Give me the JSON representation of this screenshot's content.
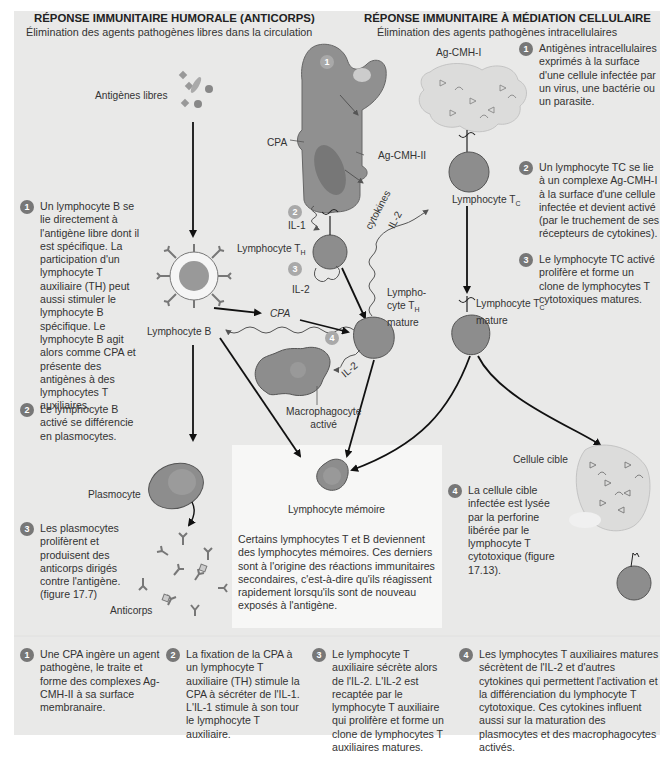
{
  "humoral": {
    "title": "RÉPONSE IMMUNITAIRE HUMORALE (ANTICORPS)",
    "subtitle": "Élimination des agents pathogènes libres dans la circulation",
    "steps": [
      {
        "number": "1",
        "text": "Un lymphocyte B se lie directement à l'antigène libre dont il est spécifique. La participation d'un lymphocyte T auxiliaire (TH) peut aussi stimuler le lymphocyte B spécifique. Le lymphocyte B agit alors comme CPA et présente des antigènes à des lymphocytes T auxiliaires."
      },
      {
        "number": "2",
        "text": "Le lymphocyte B activé se différencie en plasmocytes."
      },
      {
        "number": "3",
        "text": "Les plasmocytes prolifèrent et produisent des anticorps dirigés contre l'antigène. (figure 17.7)"
      }
    ]
  },
  "cellular": {
    "title": "RÉPONSE IMMUNITAIRE À MÉDIATION CELLULAIRE",
    "subtitle": "Élimination des agents pathogènes intracellulaires",
    "steps": [
      {
        "number": "1",
        "text": "Antigènes intracellulaires exprimés à la surface d'une cellule infectée par un virus, une bactérie ou un parasite."
      },
      {
        "number": "2",
        "text": "Un lymphocyte TC se lie à un complexe Ag-CMH-I à la surface d'une cellule infectée et devient activé (par le truchement de ses récepteurs de cytokines)."
      },
      {
        "number": "3",
        "text": "Le lymphocyte TC activé prolifère et forme un clone de lymphocytes T cytotoxiques matures."
      },
      {
        "number": "4",
        "text": "La cellule cible infectée est lysée par la perforine libérée par le lymphocyte T cytotoxique (figure 17.13)."
      }
    ]
  },
  "labels": {
    "free_antigens": "Antigènes libres",
    "cpa": "CPA",
    "ag_cmh_ii": "Ag-CMH-II",
    "ag_cmh_i": "Ag-CMH-I",
    "il1": "IL-1",
    "il2_a": "IL-2",
    "il2_b": "IL-2",
    "il2_c": "IL-2",
    "cytokines": "cytokines",
    "lymphocyte_th": "Lymphocyte T",
    "lymphocyte_th_sub": "H",
    "lymphocyte_th_mature_1": "Lympho-",
    "lymphocyte_th_mature_2": "cyte T",
    "lymphocyte_th_mature_3": "mature",
    "lymphocyte_b": "Lymphocyte B",
    "cpa_arrow": "CPA",
    "macrophage_1": "Macrophagocyte",
    "macrophage_2": "activé",
    "lymphocyte_tc": "Lymphocyte T",
    "lymphocyte_tc_sub": "C",
    "lymphocyte_tc_mature_1": "Lymphocyte T",
    "lymphocyte_tc_mature_2": "mature",
    "plasmocyte": "Plasmocyte",
    "anticorps": "Anticorps",
    "memory": "Lymphocyte mémoire",
    "target_cell": "Cellule cible"
  },
  "diagram_markers": [
    "1",
    "2",
    "3",
    "4"
  ],
  "memory_text": "Certains lymphocytes T et B deviennent des lymphocytes mémoires. Ces derniers sont à l'origine des réactions immunitaires secondaires, c'est-à-dire qu'ils réagissent rapidement lorsqu'ils sont de nouveau exposés à l'antigène.",
  "bottom_steps": [
    {
      "number": "1",
      "text": "Une CPA ingère un agent pathogène, le traite et forme des complexes Ag-CMH-II à sa surface membranaire."
    },
    {
      "number": "2",
      "text": "La fixation de la CPA à un lymphocyte T auxiliaire (TH) stimule la CPA à sécréter de l'IL-1. L'IL-1 stimule à son tour le lymphocyte T auxiliaire."
    },
    {
      "number": "3",
      "text": "Le lymphocyte T auxiliaire sécrète alors de l'IL-2. L'IL-2 est recaptée par le lymphocyte T auxiliaire qui prolifère et forme un clone de lymphocytes T auxiliaires matures."
    },
    {
      "number": "4",
      "text": "Les lymphocytes T auxiliaires matures sécrètent de l'IL-2 et d'autres cytokines qui permettent l'activation et la différenciation du lymphocyte T cytotoxique. Ces cytokines influent aussi sur la maturation des plasmocytes et des macrophagocytes activés."
    }
  ],
  "colors": {
    "panel": "#e9e9e8",
    "cell": "#8f8f8f",
    "nucleus": "#777777",
    "marker_dark": "#777777",
    "marker_light": "#a9a9a9",
    "infected_cell": "#d6d6d5"
  }
}
